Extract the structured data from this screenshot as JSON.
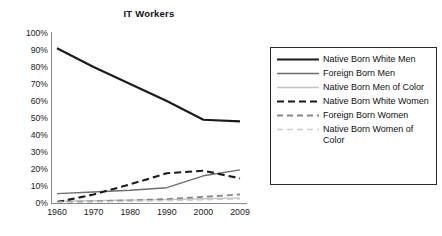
{
  "chart_data": {
    "type": "line",
    "title": "IT Workers",
    "xlabel": "",
    "ylabel": "",
    "x": [
      "1960",
      "1970",
      "1980",
      "1990",
      "2000",
      "2009"
    ],
    "categories": [
      "1960",
      "1970",
      "1980",
      "1990",
      "2000",
      "2009"
    ],
    "ylim": [
      0,
      100
    ],
    "yticks": [
      "0%",
      "10%",
      "20%",
      "30%",
      "40%",
      "50%",
      "60%",
      "70%",
      "80%",
      "90%",
      "100%"
    ],
    "ytick_values": [
      0,
      10,
      20,
      30,
      40,
      50,
      60,
      70,
      80,
      90,
      100
    ],
    "grid": false,
    "legend_position": "right",
    "value_suffix": "%",
    "series": [
      {
        "name": "Native Born White Men",
        "values": [
          91,
          80,
          70,
          60,
          49,
          48
        ],
        "color": "#1a1a1a",
        "width": 2.1,
        "dash": "none"
      },
      {
        "name": "Foreign Born Men",
        "values": [
          5.5,
          6.5,
          7.5,
          9,
          16,
          19.5
        ],
        "color": "#6e6e6e",
        "width": 1.4,
        "dash": "none"
      },
      {
        "name": "Native Born Men of Color",
        "values": [
          1,
          1.3,
          1.7,
          2,
          2.5,
          3
        ],
        "color": "#c4c4c4",
        "width": 1.4,
        "dash": "none"
      },
      {
        "name": "Native Born White Women",
        "values": [
          0.5,
          5,
          11,
          17.5,
          19,
          14.5
        ],
        "color": "#1a1a1a",
        "width": 2.1,
        "dash": "7,4"
      },
      {
        "name": "Foreign Born Women",
        "values": [
          0.5,
          1,
          1.6,
          2.3,
          3.6,
          5
        ],
        "color": "#878787",
        "width": 1.8,
        "dash": "6,4"
      },
      {
        "name": "Native Born Women of Color",
        "values": [
          0.3,
          0.6,
          1,
          1.4,
          1.9,
          2.4
        ],
        "color": "#cccccc",
        "width": 1.5,
        "dash": "6,4"
      }
    ]
  },
  "legend": {
    "items": [
      {
        "label": "Native Born White Men"
      },
      {
        "label": "Foreign Born Men"
      },
      {
        "label": "Native Born Men of Color"
      },
      {
        "label": "Native Born White Women"
      },
      {
        "label": "Foreign Born Women"
      },
      {
        "label": "Native Born Women of Color"
      }
    ]
  },
  "colors": {
    "axis": "#8a8a8a",
    "text": "#1a1a1a",
    "legend_border": "#2a2a2a",
    "background": "#ffffff"
  }
}
